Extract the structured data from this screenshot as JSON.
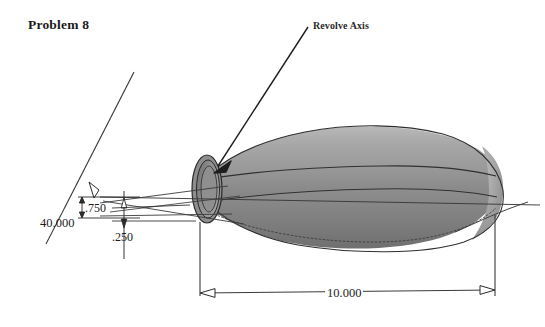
{
  "page": {
    "title": "Problem 8",
    "background_color": "#ffffff",
    "width": 545,
    "height": 327
  },
  "annotations": {
    "revolve_axis": "Revolve Axis"
  },
  "dimensions": {
    "angle": "40.000",
    "upper_offset": ".750",
    "lower_offset": ".250",
    "overall_length": "10.000"
  },
  "model": {
    "description": "shaded revolved solid",
    "shading": {
      "highlight": "#b6b6b6",
      "light": "#a3a3a3",
      "mid": "#919191",
      "dark": "#7f7f7f",
      "darker": "#6e6e6e",
      "bore": "#8a8a8a",
      "bore_dark": "#5f5f5f",
      "outline": "#2e2e2e"
    },
    "line_color": "#3a3a3a"
  }
}
